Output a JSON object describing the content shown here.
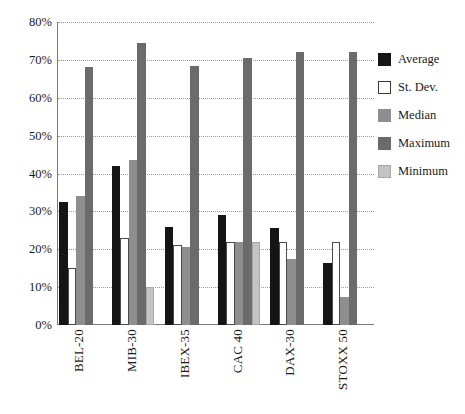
{
  "chart_data": {
    "type": "bar",
    "title": "",
    "subtitle": "",
    "xlabel": "",
    "ylabel": "",
    "ylim": [
      0,
      80
    ],
    "ytick_values": [
      0,
      10,
      20,
      30,
      40,
      50,
      60,
      70,
      80
    ],
    "ytick_labels": [
      "0%",
      "10%",
      "20%",
      "30%",
      "40%",
      "50%",
      "60%",
      "70%",
      "80%"
    ],
    "grid": true,
    "grid_axis": "y",
    "legend_position": "right",
    "categories": [
      "BEL-20",
      "MIB-30",
      "IBEX-35",
      "CAC 40",
      "DAX-30",
      "STOXX 50"
    ],
    "series": [
      {
        "name": "Average",
        "color": "#151515",
        "values": [
          32.5,
          42.0,
          26.0,
          29.0,
          25.5,
          16.5
        ]
      },
      {
        "name": "St. Dev.",
        "color": "#ffffff",
        "values": [
          15.0,
          23.0,
          21.0,
          22.0,
          22.0,
          22.0
        ]
      },
      {
        "name": "Median",
        "color": "#8e8e8e",
        "values": [
          34.0,
          43.5,
          20.5,
          22.0,
          17.5,
          7.5
        ]
      },
      {
        "name": "Maximum",
        "color": "#6b6b6b",
        "values": [
          68.0,
          74.5,
          68.5,
          70.5,
          72.0,
          72.0
        ]
      },
      {
        "name": "Minimum",
        "color": "#c3c3c3",
        "values": [
          0,
          10.0,
          0,
          22.0,
          0,
          0
        ]
      }
    ]
  },
  "legend": {
    "items": [
      {
        "label": "Average"
      },
      {
        "label": "St. Dev."
      },
      {
        "label": "Median"
      },
      {
        "label": "Maximum"
      },
      {
        "label": "Minimum"
      }
    ]
  }
}
